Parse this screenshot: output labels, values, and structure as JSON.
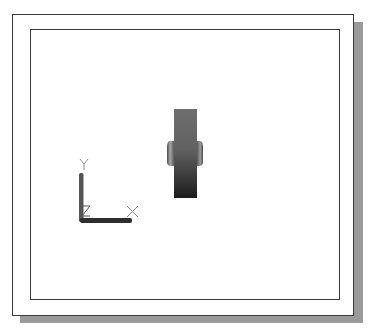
{
  "viewport": {
    "description": "CAD model space viewport showing gear side view with UCS icon",
    "frame_color": "#3a3a3a",
    "shadow_color": "#9a9a9a",
    "background_color": "#ffffff"
  },
  "model": {
    "name": "gear-side-view",
    "shading": "gradient gray",
    "colors": {
      "light": "#7a7a7a",
      "mid": "#5a5a5a",
      "dark": "#1e1e1e",
      "hub_highlight": "#9a9a9a"
    }
  },
  "ucs_icon": {
    "labels": {
      "x": "X",
      "y": "Y",
      "z": "Z"
    },
    "color": "#3a3a3a",
    "label_color": "#888888"
  }
}
